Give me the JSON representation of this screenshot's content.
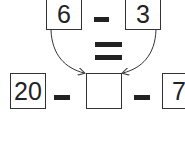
{
  "top_row": {
    "left_value": "6",
    "operator": "-",
    "right_value": "3"
  },
  "equals_sign": "=",
  "bottom_row": {
    "left_value": "20",
    "operator_1": "-",
    "middle_value": "",
    "operator_2": "-",
    "right_value": "7"
  }
}
